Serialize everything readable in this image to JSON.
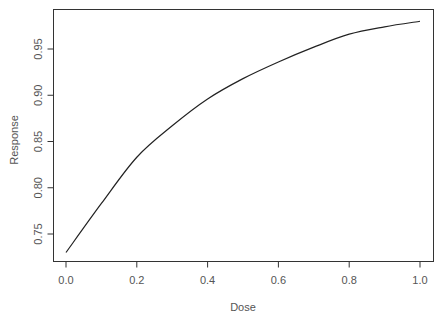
{
  "chart_data": {
    "type": "line",
    "title": "",
    "xlabel": "Dose",
    "ylabel": "Response",
    "xlim": [
      -0.035,
      1.035
    ],
    "ylim": [
      0.7185,
      0.9915
    ],
    "grid": false,
    "legend": null,
    "x_ticks": [
      0.0,
      0.2,
      0.4,
      0.6,
      0.8,
      1.0
    ],
    "x_tick_labels": [
      "0.0",
      "0.2",
      "0.4",
      "0.6",
      "0.8",
      "1.0"
    ],
    "y_ticks": [
      0.75,
      0.8,
      0.85,
      0.9,
      0.95
    ],
    "y_tick_labels": [
      "0.75",
      "0.80",
      "0.85",
      "0.90",
      "0.95"
    ],
    "series": [
      {
        "name": "Response",
        "color": "#222222",
        "x": [
          0.0,
          0.1,
          0.2,
          0.3,
          0.4,
          0.5,
          0.6,
          0.7,
          0.8,
          0.9,
          1.0
        ],
        "values": [
          0.73,
          0.783,
          0.833,
          0.867,
          0.896,
          0.918,
          0.936,
          0.952,
          0.966,
          0.974,
          0.98
        ]
      }
    ]
  },
  "labels": {
    "xlabel": "Dose",
    "ylabel": "Response"
  }
}
